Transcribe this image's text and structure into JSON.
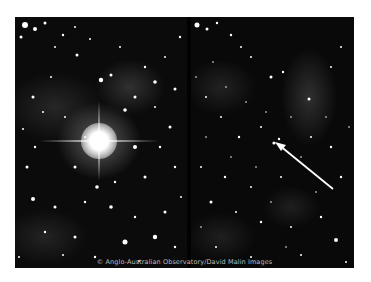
{
  "figure": {
    "panels": [
      {
        "name": "left",
        "feature": "bright star with diffraction spikes"
      },
      {
        "name": "right",
        "feature": "arrow pointing to faint star"
      }
    ],
    "caption": "© Anglo-Australian Observatory/David Malin Images",
    "colors": {
      "background": "#ffffff",
      "sky": "#0a0a0a",
      "stars": "#ffffff",
      "arrow": "#ffffff"
    }
  }
}
